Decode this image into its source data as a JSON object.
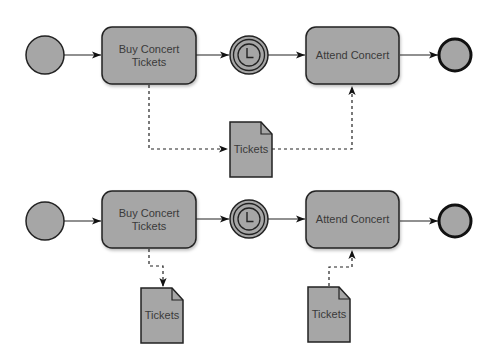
{
  "diagram": {
    "type": "bpmn-process",
    "colors": {
      "shape_fill": "#a6a6a6",
      "stroke": "#222222",
      "text": "#3a3a3a",
      "background": "#ffffff"
    },
    "rows": [
      {
        "name": "direct-data-association",
        "start_event": {
          "label": ""
        },
        "task_1": {
          "label": "Buy Concert Tickets",
          "line1": "Buy Concert",
          "line2": "Tickets"
        },
        "timer_event": {
          "label": "",
          "icon": "clock-icon"
        },
        "task_2": {
          "label": "Attend Concert"
        },
        "end_event": {
          "label": ""
        },
        "data_object": {
          "label": "Tickets"
        }
      },
      {
        "name": "split-data-association",
        "start_event": {
          "label": ""
        },
        "task_1": {
          "label": "Buy Concert Tickets",
          "line1": "Buy Concert",
          "line2": "Tickets"
        },
        "timer_event": {
          "label": "",
          "icon": "clock-icon"
        },
        "task_2": {
          "label": "Attend Concert"
        },
        "end_event": {
          "label": ""
        },
        "data_object_output": {
          "label": "Tickets"
        },
        "data_object_input": {
          "label": "Tickets"
        }
      }
    ]
  }
}
